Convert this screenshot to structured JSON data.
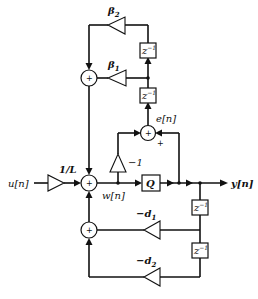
{
  "diagram": {
    "type": "signal-flow block diagram (noise-shaping quantizer)",
    "input": {
      "label": "u[n]"
    },
    "output": {
      "label": "y[n]"
    },
    "gains": {
      "input_scale": "1/L",
      "neg_one": "−1",
      "beta1": "β",
      "beta1_sub": "1",
      "beta2": "β",
      "beta2_sub": "2",
      "d1": "−d",
      "d1_sub": "1",
      "d2": "−d",
      "d2_sub": "2"
    },
    "signals": {
      "w": "w[n]",
      "e": "e[n]"
    },
    "quantizer": {
      "label": "Q"
    },
    "delays": {
      "label": "z",
      "exponent": "−1"
    },
    "summers": {
      "symbol": "+",
      "e_plus_sign": "+"
    }
  }
}
